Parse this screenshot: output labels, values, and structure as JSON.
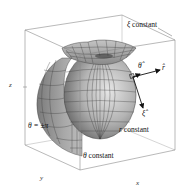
{
  "figure": {
    "colors": {
      "surface_fill": "#9a9a9a",
      "surface_light": "#d4d4d4",
      "grid_lines": "#3a3a3a",
      "box_edges": "#8a8a8a",
      "arrows": "#111111",
      "background": "#ffffff"
    }
  },
  "labels": {
    "xi_constant": {
      "symbol": "ξ",
      "text": "constant"
    },
    "theta_hat": "θ̂",
    "r_hat": "r̂",
    "xi_hat": "ξ̂",
    "r_constant": {
      "symbol": "r",
      "text": "constant"
    },
    "theta_pm_pi": "θ = ±π",
    "theta_constant": {
      "symbol": "θ",
      "text": "constant"
    }
  },
  "axes": {
    "x": "x",
    "y": "y",
    "z": "z"
  }
}
